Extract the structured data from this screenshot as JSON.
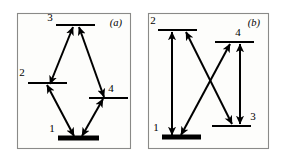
{
  "figure": {
    "background_color": "#ffffff",
    "frame_color": "#8a8a88",
    "line_color": "#000000",
    "width": 285,
    "height": 163
  },
  "panels": [
    {
      "tag": "(a)",
      "name": "diamond-scheme",
      "frame": {
        "x": 17,
        "y": 13,
        "w": 113,
        "h": 135
      },
      "levels": [
        {
          "id": "1",
          "label": "1",
          "x1": 58,
          "x2": 99,
          "y": 138,
          "weight": "thick",
          "label_x": 52,
          "label_y": 132
        },
        {
          "id": "2",
          "label": "2",
          "x1": 28,
          "x2": 67,
          "y": 83,
          "weight": "thin",
          "label_x": 22,
          "label_y": 76
        },
        {
          "id": "3",
          "label": "3",
          "x1": 56,
          "x2": 95,
          "y": 25,
          "weight": "thin",
          "label_x": 50,
          "label_y": 21
        },
        {
          "id": "4",
          "label": "4",
          "x1": 89,
          "x2": 128,
          "y": 98,
          "weight": "thin",
          "label_x": 111,
          "label_y": 92
        }
      ],
      "transitions": [
        {
          "from": "2",
          "to": "3",
          "double_headed": true,
          "x1": 50,
          "y1": 84,
          "x2": 73,
          "y2": 27
        },
        {
          "from": "3",
          "to": "4",
          "double_headed": true,
          "x1": 79,
          "y1": 27,
          "x2": 104,
          "y2": 97
        },
        {
          "from": "1",
          "to": "2",
          "double_headed": true,
          "x1": 47,
          "y1": 85,
          "x2": 74,
          "y2": 136
        },
        {
          "from": "1",
          "to": "4",
          "double_headed": true,
          "x1": 103,
          "y1": 99,
          "x2": 82,
          "y2": 136
        }
      ]
    },
    {
      "tag": "(b)",
      "name": "n-cross-scheme",
      "frame": {
        "x": 148,
        "y": 13,
        "w": 120,
        "h": 135
      },
      "levels": [
        {
          "id": "1",
          "label": "1",
          "x1": 162,
          "x2": 201,
          "y": 137,
          "weight": "thick",
          "label_x": 156,
          "label_y": 131
        },
        {
          "id": "2",
          "label": "2",
          "x1": 158,
          "x2": 197,
          "y": 30,
          "weight": "thin",
          "label_x": 153,
          "label_y": 24
        },
        {
          "id": "3",
          "label": "3",
          "x1": 212,
          "x2": 251,
          "y": 126,
          "weight": "thin",
          "label_x": 253,
          "label_y": 120
        },
        {
          "id": "4",
          "label": "4",
          "x1": 215,
          "x2": 254,
          "y": 42,
          "weight": "thin",
          "label_x": 238,
          "label_y": 36
        }
      ],
      "transitions": [
        {
          "from": "1",
          "to": "2",
          "double_headed": true,
          "x1": 172,
          "y1": 135,
          "x2": 172,
          "y2": 32
        },
        {
          "from": "1",
          "to": "4",
          "double_headed": true,
          "x1": 181,
          "y1": 135,
          "x2": 230,
          "y2": 44
        },
        {
          "from": "2",
          "to": "3",
          "double_headed": true,
          "x1": 186,
          "y1": 32,
          "x2": 232,
          "y2": 124
        },
        {
          "from": "3",
          "to": "4",
          "double_headed": true,
          "x1": 240,
          "y1": 124,
          "x2": 240,
          "y2": 44
        }
      ]
    }
  ]
}
